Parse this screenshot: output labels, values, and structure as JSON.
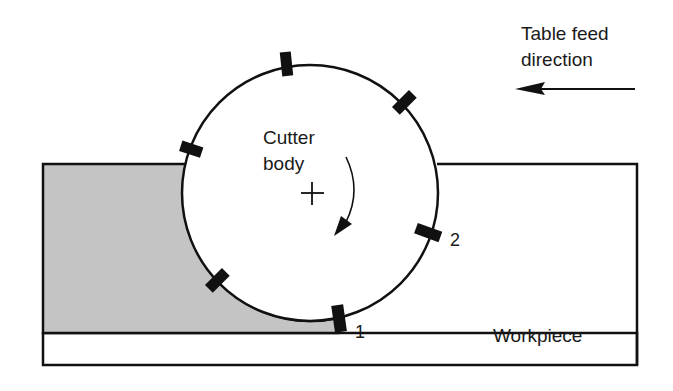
{
  "diagram": {
    "labels": {
      "feed_line1": "Table feed",
      "feed_line2": "direction",
      "cutter_line1": "Cutter",
      "cutter_line2": "body",
      "insert_1": "1",
      "insert_2": "2",
      "workpiece": "Workpiece"
    },
    "colors": {
      "ink": "#111111",
      "machined_fill": "#c4c4c4",
      "background": "#ffffff"
    },
    "geometry": {
      "cutter_center": [
        310,
        193
      ],
      "cutter_radius": 128,
      "insert_count": 7
    }
  }
}
